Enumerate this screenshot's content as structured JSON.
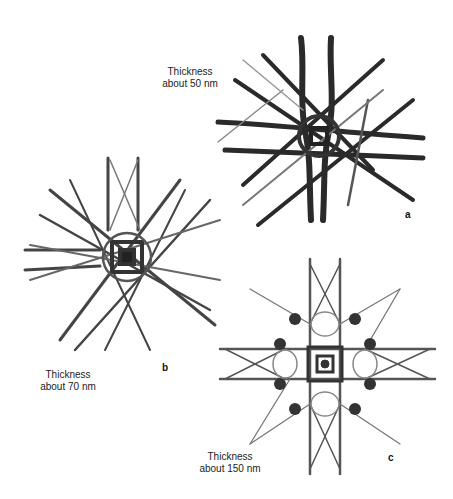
{
  "figure": {
    "panels": [
      {
        "id": "a",
        "label": "a",
        "caption_line1": "Thickness",
        "caption_line2": "about 50 nm"
      },
      {
        "id": "b",
        "label": "b",
        "caption_line1": "Thickness",
        "caption_line2": "about 70 nm"
      },
      {
        "id": "c",
        "label": "c",
        "caption_line1": "Thickness",
        "caption_line2": "about 150 nm"
      }
    ]
  }
}
